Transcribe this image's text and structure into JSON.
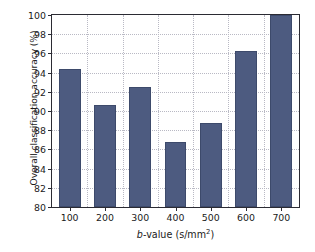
{
  "chart_data": {
    "type": "bar",
    "title": "",
    "subtitle": "",
    "xlabel": "b-value (s/mm2)",
    "xlabel_parts": {
      "italic": "b",
      "rest": "-value (s/mm",
      "sup": "2",
      "tail": ")"
    },
    "ylabel": "Overall classification accuracy (%)",
    "categories": [
      "100",
      "200",
      "300",
      "400",
      "500",
      "600",
      "700"
    ],
    "values": [
      94.4,
      90.6,
      92.5,
      86.8,
      88.7,
      96.3,
      100.0
    ],
    "series": [
      {
        "name": "Overall classification accuracy",
        "values": [
          94.4,
          90.6,
          92.5,
          86.8,
          88.7,
          96.3,
          100.0
        ]
      }
    ],
    "ylim": [
      80,
      100
    ],
    "ytick_step": 2,
    "yticks": [
      "100",
      "98",
      "96",
      "94",
      "92",
      "90",
      "88",
      "86",
      "84",
      "82",
      "80"
    ],
    "ytick_values": [
      100,
      98,
      96,
      94,
      92,
      90,
      88,
      86,
      84,
      82,
      80
    ],
    "xticks": [
      "100",
      "200",
      "300",
      "400",
      "500",
      "600",
      "700"
    ],
    "grid": true,
    "grid_style": "dotted",
    "legend": false,
    "legend_position": "none",
    "bar_color": "#4d5b80",
    "bar_edge_color": "#3d4a6b",
    "grid_color": "#b9b9c4",
    "axis_color": "#2b2b33",
    "background_color": "#ffffff"
  }
}
